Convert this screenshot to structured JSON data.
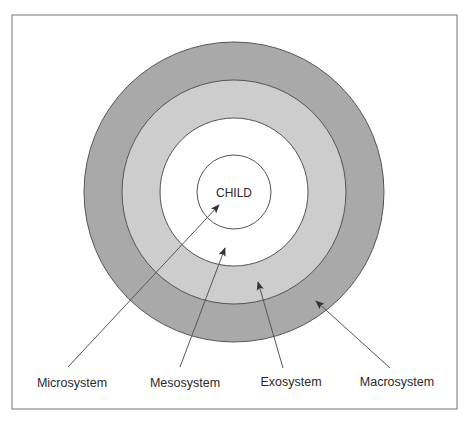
{
  "diagram": {
    "center_label": "CHILD",
    "colors": {
      "frame": "#8a8a8a",
      "macrosystem_fill": "#a9a9a9",
      "exosystem_fill": "#cdcdcd",
      "mesosystem_fill": "#ffffff",
      "microsystem_fill": "#ffffff",
      "ring_stroke": "#555555",
      "arrow": "#444444",
      "text": "#2a2a2a"
    },
    "rings": [
      {
        "name": "Macrosystem",
        "r": 150
      },
      {
        "name": "Exosystem",
        "r": 112
      },
      {
        "name": "Mesosystem",
        "r": 74
      },
      {
        "name": "Microsystem",
        "r": 37
      }
    ],
    "labels": [
      {
        "text": "Microsystem"
      },
      {
        "text": "Mesosystem"
      },
      {
        "text": "Exosystem"
      },
      {
        "text": "Macrosystem"
      }
    ]
  }
}
